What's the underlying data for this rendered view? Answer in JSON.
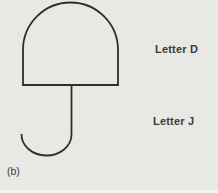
{
  "figure": {
    "caption": "(b)",
    "labels": {
      "d": "Letter D",
      "j": "Letter J"
    },
    "shapes": {
      "dome": "letter-d-rotated-dome",
      "hook": "letter-j-hook"
    },
    "colors": {
      "background": "#e8e8e5",
      "line": "#2e2e2e",
      "text": "#3b3b3b"
    }
  }
}
